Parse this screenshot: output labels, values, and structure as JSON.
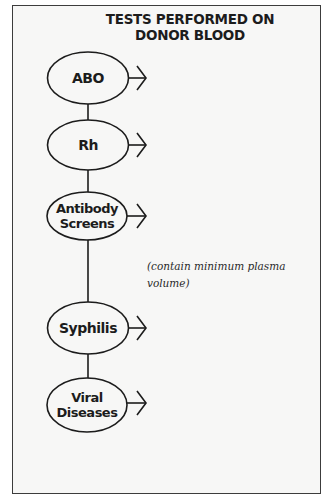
{
  "title": {
    "line1": "TESTS PERFORMED ON",
    "line2": "DONOR BLOOD"
  },
  "nodes": [
    {
      "id": "abo",
      "label_lines": [
        "ABO"
      ]
    },
    {
      "id": "rh",
      "label_lines": [
        "Rh"
      ]
    },
    {
      "id": "antibody-screens",
      "label_lines": [
        "Antibody",
        "Screens"
      ]
    },
    {
      "id": "syphilis",
      "label_lines": [
        "Syphilis"
      ]
    },
    {
      "id": "viral-diseases",
      "label_lines": [
        "Viral",
        "Diseases"
      ]
    }
  ],
  "note": {
    "line1": "(contain minimum plasma",
    "line2": "volume)"
  },
  "colors": {
    "stroke": "#1c1c1c",
    "frame_border": "#3c3c3c",
    "background": "#f7f7f6"
  }
}
